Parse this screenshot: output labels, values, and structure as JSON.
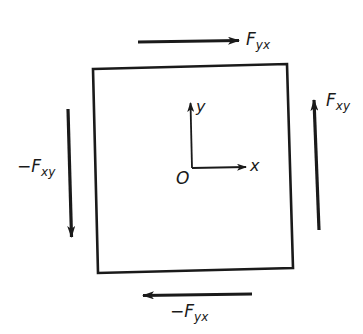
{
  "diagram": {
    "type": "shear-forces-on-square-element",
    "colors": {
      "line": "#1a1a1a",
      "background": "#ffffff"
    },
    "element": {
      "shape": "square",
      "corners": {
        "top_left": [
          93,
          69
        ],
        "top_right": [
          287,
          64
        ],
        "bottom_right": [
          293,
          268
        ],
        "bottom_left": [
          98,
          273
        ]
      }
    },
    "axes": {
      "origin_label": "O",
      "x_label": "x",
      "y_label": "y"
    },
    "forces": {
      "top": {
        "base": "F",
        "sub": "yx",
        "sign": "",
        "direction": "right"
      },
      "bottom": {
        "base": "F",
        "sub": "yx",
        "sign": "−",
        "direction": "left"
      },
      "right": {
        "base": "F",
        "sub": "xy",
        "sign": "",
        "direction": "up"
      },
      "left": {
        "base": "F",
        "sub": "xy",
        "sign": "−",
        "direction": "down"
      }
    }
  }
}
